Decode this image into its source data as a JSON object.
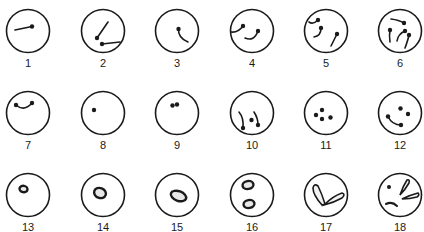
{
  "diagram": {
    "type": "staged-sequence",
    "layout": {
      "rows": 3,
      "columns": 6
    },
    "colors": {
      "ink": "#1a1a1a",
      "background": "#ffffff",
      "fill": "#e8e8e8"
    },
    "panels": [
      {
        "number": "1",
        "content": "single rod with terminal dot"
      },
      {
        "number": "2",
        "content": "two rods each with terminal dot"
      },
      {
        "number": "3",
        "content": "one curved rod with terminal dot"
      },
      {
        "number": "4",
        "content": "two curved rods with terminal dots"
      },
      {
        "number": "5",
        "content": "three curved rods with terminal dots"
      },
      {
        "number": "6",
        "content": "four curved rods with terminal dots"
      },
      {
        "number": "7",
        "content": "one short curved rod with dots at both ends"
      },
      {
        "number": "8",
        "content": "single dot"
      },
      {
        "number": "9",
        "content": "two adjacent dots"
      },
      {
        "number": "10",
        "content": "two curved rods and a central dot"
      },
      {
        "number": "11",
        "content": "four dots"
      },
      {
        "number": "12",
        "content": "two dots and a curved rod with dots"
      },
      {
        "number": "13",
        "content": "small dark oval body"
      },
      {
        "number": "14",
        "content": "larger oval body"
      },
      {
        "number": "15",
        "content": "elongated oval body"
      },
      {
        "number": "16",
        "content": "two oval bodies"
      },
      {
        "number": "17",
        "content": "two elongated petal-shaped bodies joined at base"
      },
      {
        "number": "18",
        "content": "two petal-shaped bodies, a dot and a curved rod"
      }
    ]
  }
}
